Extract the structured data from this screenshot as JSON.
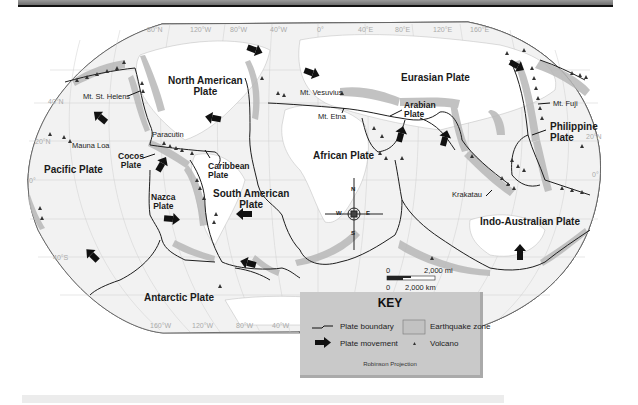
{
  "map": {
    "projection": "Robinson Projection",
    "plates": [
      {
        "name": "North American Plate",
        "line1": "North American",
        "line2": "Plate"
      },
      {
        "name": "Eurasian Plate",
        "line1": "Eurasian Plate"
      },
      {
        "name": "Pacific Plate",
        "line1": "Pacific Plate"
      },
      {
        "name": "Cocos Plate",
        "line1": "Cocos",
        "line2": "Plate"
      },
      {
        "name": "Caribbean Plate",
        "line1": "Caribbean",
        "line2": "Plate"
      },
      {
        "name": "Nazca Plate",
        "line1": "Nazca",
        "line2": "Plate"
      },
      {
        "name": "South American Plate",
        "line1": "South American",
        "line2": "Plate"
      },
      {
        "name": "African Plate",
        "line1": "African Plate"
      },
      {
        "name": "Arabian Plate",
        "line1": "Arabian",
        "line2": "Plate"
      },
      {
        "name": "Philippine Plate",
        "line1": "Philippine",
        "line2": "Plate"
      },
      {
        "name": "Indo-Australian Plate",
        "line1": "Indo-Australian Plate"
      },
      {
        "name": "Antarctic Plate",
        "line1": "Antarctic Plate"
      }
    ],
    "volcanoes": [
      "Mt. St. Helens",
      "Mauna Loa",
      "Paracutin",
      "Mt. Vesuvius",
      "Mt. Etna",
      "Mt. Fuji",
      "Krakatau"
    ],
    "grid_top": [
      "80°N",
      "120°W",
      "80°W",
      "40°W",
      "0°",
      "40°E",
      "80°E",
      "120°E",
      "160°E"
    ],
    "grid_bottom": [
      "160°W",
      "120°W",
      "80°W",
      "40°W"
    ],
    "grid_left": [
      "40°N",
      "20°N",
      "0°",
      "40°S"
    ],
    "grid_right": [
      "20°N",
      "0°"
    ],
    "compass": {
      "n": "N",
      "s": "S",
      "e": "E",
      "w": "W"
    },
    "scale": {
      "zero_mi": "0",
      "mi": "2,000 mi",
      "zero_km": "0",
      "km": "2,000 km"
    }
  },
  "key": {
    "title": "KEY",
    "plate_boundary": "Plate boundary",
    "plate_movement": "Plate movement",
    "earthquake_zone": "Earthquake zone",
    "volcano": "Volcano",
    "footer": "Robinson Projection"
  }
}
